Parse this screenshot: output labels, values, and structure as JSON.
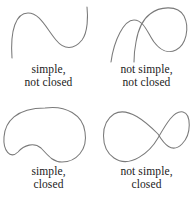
{
  "figure": {
    "background_color": "#ffffff",
    "stroke_color": "#7a7a7a",
    "text_color": "#1a1a1a"
  },
  "panels": [
    {
      "id": "simple-not-closed",
      "position": "top-left",
      "caption_line1": "simple,",
      "caption_line2": "not closed",
      "curve_name": "open-s-curve",
      "closed": false,
      "simple": true,
      "path": "M 12 58 C 10 30, 16 13, 28 13 C 40 13, 46 28, 56 40 C 64 50, 74 50, 82 40 C 88 32, 88 16, 87 7"
    },
    {
      "id": "not-simple-not-closed",
      "position": "top-right",
      "caption_line1": "not simple,",
      "caption_line2": "not closed",
      "curve_name": "open-looped-curve",
      "closed": false,
      "simple": false,
      "path": "M 13 62 C 16 40, 26 20, 36 20 C 46 20, 50 34, 56 42 C 62 50, 70 54, 78 50 C 88 45, 92 28, 86 16 C 80 5, 62 6, 52 14 C 44 20, 40 30, 38 42 C 36 52, 36 58, 36 62"
    },
    {
      "id": "simple-closed",
      "position": "bottom-left",
      "caption_line1": "simple,",
      "caption_line2": "closed",
      "curve_name": "closed-bean-curve",
      "closed": true,
      "simple": true,
      "path": "M 45 6 C 66 3, 83 13, 85 30 C 88 48, 76 60, 62 60 C 52 60, 47 52, 41 46 C 34 40, 24 43, 18 50 C 10 58, 3 48, 4 35 C 5 20, 16 6, 45 6 Z"
    },
    {
      "id": "not-simple-closed",
      "position": "bottom-right",
      "caption_line1": "not simple,",
      "caption_line2": "closed",
      "curve_name": "figure-eight-curve",
      "closed": true,
      "simple": false,
      "path": "M 60 32 C 48 20, 30 4, 16 12 C 2 21, 2 46, 16 56 C 32 67, 52 50, 60 36 C 68 22, 76 8, 85 10 C 93 12, 94 32, 84 42 C 74 52, 66 42, 60 32 Z"
    }
  ]
}
